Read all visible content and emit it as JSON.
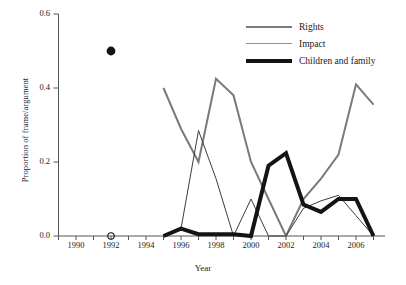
{
  "chart_data": {
    "type": "line",
    "title": "",
    "xlabel": "Year",
    "ylabel": "Proportion of frame/argument",
    "xlim": [
      1989,
      2007.6
    ],
    "ylim": [
      0.0,
      0.6
    ],
    "grid": false,
    "legend_position": "top-right",
    "y_ticks": [
      "0.0",
      "0.2",
      "0.4",
      "0.6"
    ],
    "y_tick_values": [
      0.0,
      0.2,
      0.4,
      0.6
    ],
    "x_ticks": [
      "1990",
      "1992",
      "1994",
      "1996",
      "1998",
      "2000",
      "2002",
      "2004",
      "2006"
    ],
    "x_tick_values": [
      1990,
      1992,
      1994,
      1996,
      1998,
      2000,
      2002,
      2004,
      2006
    ],
    "x_minor_tick_values": [
      1989,
      1990,
      1991,
      1992,
      1993,
      1994,
      1995,
      1996,
      1997,
      1998,
      1999,
      2000,
      2001,
      2002,
      2003,
      2004,
      2005,
      2006,
      2007
    ],
    "series": [
      {
        "name": "Rights",
        "color": "#7a7a7a",
        "width": 2.0,
        "x": [
          1995,
          1996,
          1997,
          1998,
          1999,
          2000,
          2001,
          2002,
          2003,
          2004,
          2005,
          2006,
          2007
        ],
        "values": [
          0.4,
          0.29,
          0.2,
          0.425,
          0.38,
          0.2,
          0.1,
          0.0,
          0.1,
          0.155,
          0.22,
          0.41,
          0.355
        ]
      },
      {
        "name": "Impact",
        "color": "#3c3c3c",
        "width": 1.0,
        "x": [
          1995,
          1996,
          1997,
          1998,
          1999,
          2000,
          2001,
          2002,
          2003,
          2004,
          2005,
          2006,
          2007
        ],
        "values": [
          0.0,
          0.02,
          0.285,
          0.155,
          0.0,
          0.1,
          0.0,
          0.0,
          0.075,
          0.095,
          0.11,
          0.055,
          0.0
        ]
      },
      {
        "name": "Children and family",
        "color": "#141414",
        "width": 4.0,
        "x": [
          1995,
          1996,
          1997,
          1998,
          1999,
          2000,
          2001,
          2002,
          2003,
          2004,
          2005,
          2006,
          2007
        ],
        "values": [
          0.0,
          0.02,
          0.005,
          0.005,
          0.005,
          0.0,
          0.19,
          0.224,
          0.085,
          0.065,
          0.1,
          0.1,
          0.0
        ]
      }
    ],
    "markers": [
      {
        "name": "filled-point-1992",
        "x": 1992,
        "y": 0.5,
        "style": "filled-circle",
        "color": "#141414"
      },
      {
        "name": "open-point-1992",
        "x": 1992,
        "y": 0.0,
        "style": "open-circle",
        "color": "#141414"
      }
    ]
  },
  "legend": {
    "entries": [
      {
        "label": "Rights"
      },
      {
        "label": "Impact"
      },
      {
        "label": "Children and family"
      }
    ]
  }
}
